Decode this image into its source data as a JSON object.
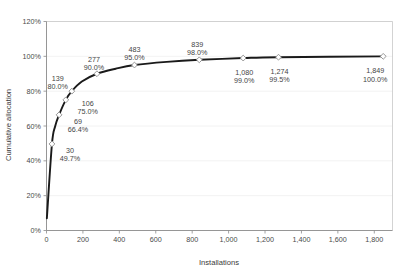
{
  "chart_data": {
    "type": "line",
    "title": "",
    "xlabel": "Installations",
    "ylabel": "Cumulative allocation",
    "xlim": [
      0,
      1900
    ],
    "ylim": [
      0,
      1.2
    ],
    "grid": true,
    "legend": "none",
    "x_ticks": [
      "0",
      "200",
      "400",
      "600",
      "800",
      "1,000",
      "1,200",
      "1,400",
      "1,600",
      "1,800"
    ],
    "x_tick_values": [
      0,
      200,
      400,
      600,
      800,
      1000,
      1200,
      1400,
      1600,
      1800
    ],
    "y_ticks": [
      "0%",
      "20%",
      "40%",
      "60%",
      "80%",
      "100%",
      "120%"
    ],
    "y_tick_values": [
      0,
      0.2,
      0.4,
      0.6,
      0.8,
      1.0,
      1.2
    ],
    "x": [
      2,
      30,
      48,
      69,
      106,
      139,
      194,
      277,
      380,
      483,
      660,
      839,
      1080,
      1274,
      1849
    ],
    "values": [
      0.07,
      0.497,
      0.6,
      0.664,
      0.75,
      0.8,
      0.855,
      0.9,
      0.929,
      0.95,
      0.968,
      0.98,
      0.99,
      0.995,
      1.0
    ],
    "annotations": [
      {
        "x": 30,
        "y": 0.497,
        "installs": "30",
        "percent": "49.7%"
      },
      {
        "x": 69,
        "y": 0.664,
        "installs": "69",
        "percent": "66.4%"
      },
      {
        "x": 106,
        "y": 0.75,
        "installs": "106",
        "percent": "75.0%"
      },
      {
        "x": 139,
        "y": 0.8,
        "installs": "139",
        "percent": "80.0%"
      },
      {
        "x": 277,
        "y": 0.9,
        "installs": "277",
        "percent": "90.0%"
      },
      {
        "x": 483,
        "y": 0.95,
        "installs": "483",
        "percent": "95.0%"
      },
      {
        "x": 839,
        "y": 0.98,
        "installs": "839",
        "percent": "98.0%"
      },
      {
        "x": 1080,
        "y": 0.99,
        "installs": "1,080",
        "percent": "99.0%"
      },
      {
        "x": 1274,
        "y": 0.995,
        "installs": "1,274",
        "percent": "99.5%"
      },
      {
        "x": 1849,
        "y": 1.0,
        "installs": "1,849",
        "percent": "100.0%"
      }
    ],
    "markers": [
      {
        "x": 30,
        "y": 0.497
      },
      {
        "x": 69,
        "y": 0.664
      },
      {
        "x": 106,
        "y": 0.75
      },
      {
        "x": 139,
        "y": 0.8
      },
      {
        "x": 277,
        "y": 0.9
      },
      {
        "x": 483,
        "y": 0.95
      },
      {
        "x": 839,
        "y": 0.98
      },
      {
        "x": 1080,
        "y": 0.99
      },
      {
        "x": 1274,
        "y": 0.995
      },
      {
        "x": 1849,
        "y": 1.0
      }
    ],
    "colors": {
      "line": "#1a1a1a",
      "marker_fill": "#ffffff",
      "marker_stroke": "#8d8d8d",
      "grid": "#efefef",
      "axis": "#7b7b7b",
      "text": "#4a4a4a",
      "background": "#ffffff"
    }
  }
}
